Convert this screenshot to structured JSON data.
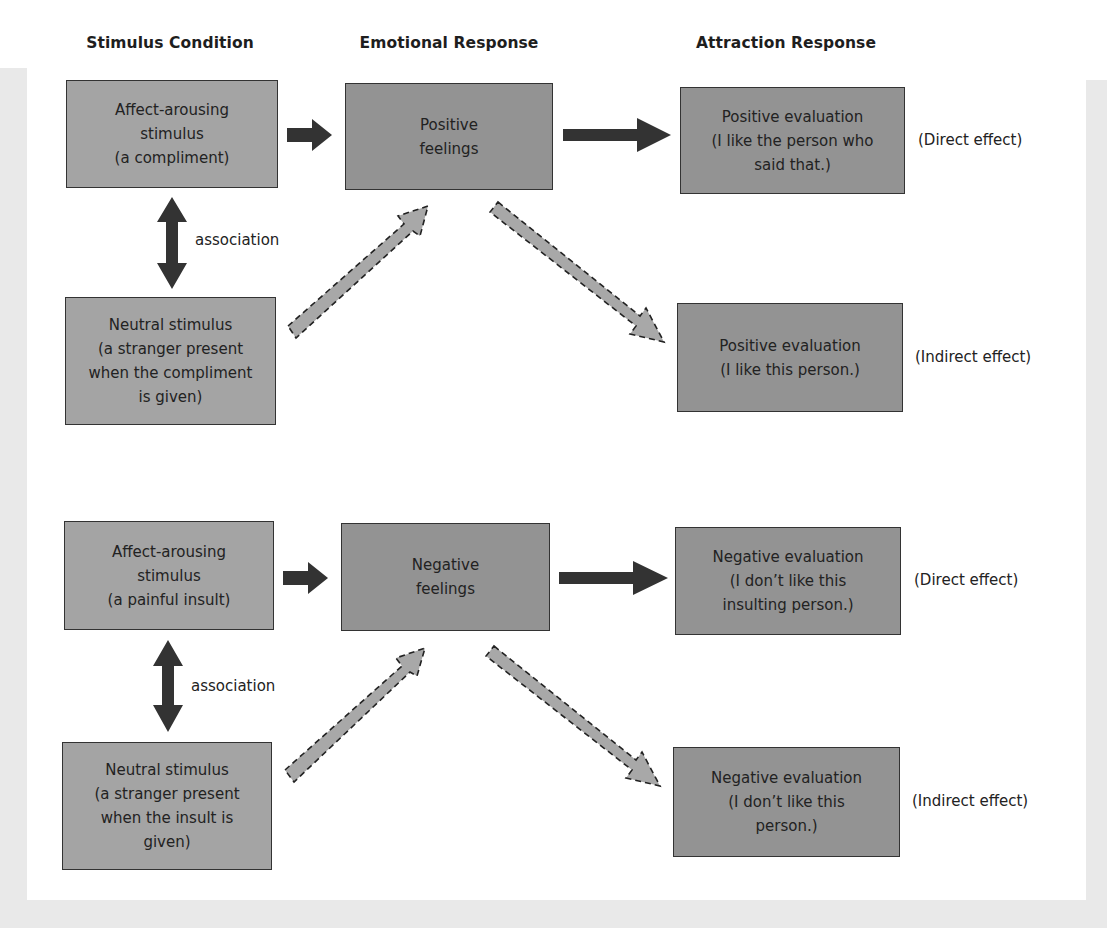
{
  "headers": {
    "stimulus": "Stimulus Condition",
    "emotional": "Emotional Response",
    "attraction": "Attraction Response"
  },
  "positive": {
    "affect_stimulus": "Affect-arousing\nstimulus\n(a compliment)",
    "emotion": "Positive\nfeelings",
    "direct_evaluation": "Positive evaluation\n(I like the person who\nsaid that.)",
    "direct_label": "(Direct effect)",
    "association_label": "association",
    "neutral_stimulus": "Neutral stimulus\n(a stranger present\nwhen the compliment\nis given)",
    "indirect_evaluation": "Positive evaluation\n(I like this person.)",
    "indirect_label": "(Indirect effect)"
  },
  "negative": {
    "affect_stimulus": "Affect-arousing\nstimulus\n(a painful insult)",
    "emotion": "Negative\nfeelings",
    "direct_evaluation": "Negative evaluation\n(I don’t like this\ninsulting person.)",
    "direct_label": "(Direct effect)",
    "association_label": "association",
    "neutral_stimulus": "Neutral stimulus\n(a stranger present\nwhen the insult is\ngiven)",
    "indirect_evaluation": "Negative evaluation\n(I don’t like this\nperson.)",
    "indirect_label": "(Indirect effect)"
  },
  "colors": {
    "stimulus_box": "#a4a4a4",
    "response_box": "#939393",
    "solid_arrow": "#333333",
    "dashed_arrow_fill": "#a8a8a8",
    "frame": "#e9e9e9"
  }
}
